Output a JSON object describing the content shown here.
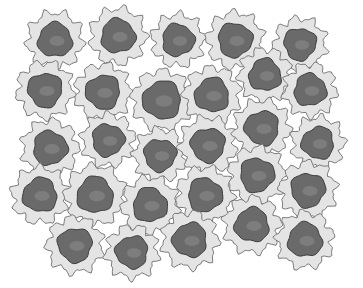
{
  "image": {
    "subject": "illustration of rounded cells with dark nuclei arranged in rows",
    "background": "#ffffff",
    "colors": {
      "membrane_fill": "#e4e4e4",
      "membrane_stroke": "#6e6e6e",
      "nucleus_fill": "#6a6a6a",
      "nucleus_stroke": "#3a3a3a",
      "nucleus_highlight": "#8c8c8c"
    },
    "cells": [
      {
        "x": 55,
        "y": 40,
        "r": 30,
        "nr": 17
      },
      {
        "x": 118,
        "y": 36,
        "r": 30,
        "nr": 17
      },
      {
        "x": 178,
        "y": 40,
        "r": 28,
        "nr": 16
      },
      {
        "x": 235,
        "y": 40,
        "r": 30,
        "nr": 17
      },
      {
        "x": 300,
        "y": 44,
        "r": 28,
        "nr": 16
      },
      {
        "x": 45,
        "y": 90,
        "r": 30,
        "nr": 17
      },
      {
        "x": 103,
        "y": 92,
        "r": 30,
        "nr": 17
      },
      {
        "x": 162,
        "y": 100,
        "r": 32,
        "nr": 19
      },
      {
        "x": 212,
        "y": 95,
        "r": 30,
        "nr": 17
      },
      {
        "x": 265,
        "y": 75,
        "r": 28,
        "nr": 16
      },
      {
        "x": 310,
        "y": 90,
        "r": 28,
        "nr": 16
      },
      {
        "x": 50,
        "y": 148,
        "r": 30,
        "nr": 17
      },
      {
        "x": 108,
        "y": 140,
        "r": 28,
        "nr": 16
      },
      {
        "x": 160,
        "y": 155,
        "r": 28,
        "nr": 16
      },
      {
        "x": 208,
        "y": 145,
        "r": 30,
        "nr": 17
      },
      {
        "x": 262,
        "y": 128,
        "r": 30,
        "nr": 17
      },
      {
        "x": 318,
        "y": 143,
        "r": 28,
        "nr": 16
      },
      {
        "x": 40,
        "y": 195,
        "r": 30,
        "nr": 17
      },
      {
        "x": 95,
        "y": 195,
        "r": 32,
        "nr": 18
      },
      {
        "x": 150,
        "y": 205,
        "r": 30,
        "nr": 17
      },
      {
        "x": 205,
        "y": 195,
        "r": 30,
        "nr": 17
      },
      {
        "x": 257,
        "y": 175,
        "r": 30,
        "nr": 17
      },
      {
        "x": 308,
        "y": 190,
        "r": 30,
        "nr": 17
      },
      {
        "x": 75,
        "y": 245,
        "r": 30,
        "nr": 17
      },
      {
        "x": 132,
        "y": 252,
        "r": 28,
        "nr": 16
      },
      {
        "x": 190,
        "y": 240,
        "r": 30,
        "nr": 17
      },
      {
        "x": 252,
        "y": 225,
        "r": 30,
        "nr": 17
      },
      {
        "x": 305,
        "y": 240,
        "r": 30,
        "nr": 17
      }
    ]
  }
}
